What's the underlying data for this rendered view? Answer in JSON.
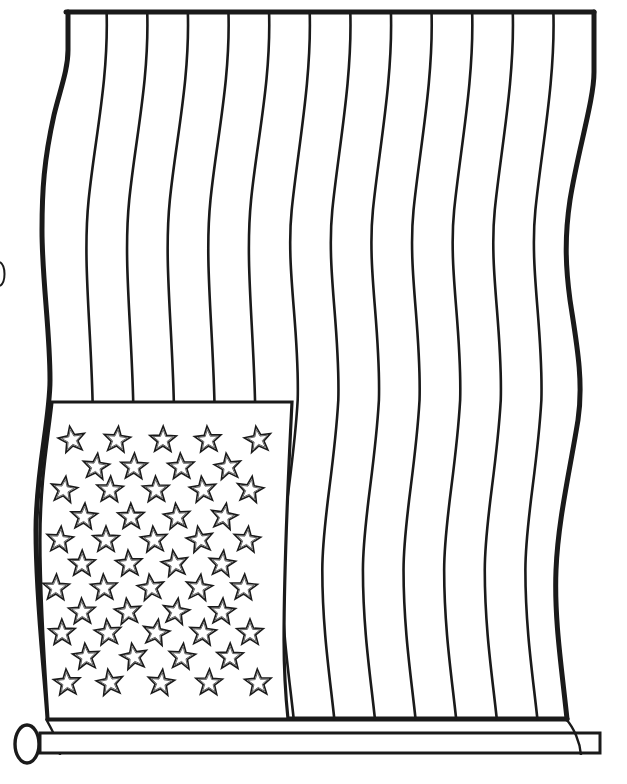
{
  "page": {
    "title": "American flag coloring page",
    "background": "#ffffff",
    "ink_color": "#1a1a1a"
  },
  "flag": {
    "stripe_count": 13,
    "divider_lines": 12,
    "star_count": 50,
    "top_edge": {
      "x1": 66,
      "x2": 594,
      "y": 12
    },
    "bottom_edge": {
      "x1": 48,
      "x2": 567,
      "y": 719
    },
    "canton": {
      "x": 48,
      "y": 402,
      "width": 244,
      "height": 317
    },
    "star_rows": [
      {
        "y": 440,
        "xs": [
          72,
          117,
          163,
          208,
          258
        ]
      },
      {
        "y": 467,
        "xs": [
          96,
          134,
          181,
          228
        ]
      },
      {
        "y": 490,
        "xs": [
          64,
          110,
          156,
          203,
          250
        ]
      },
      {
        "y": 517,
        "xs": [
          84,
          131,
          177,
          224
        ]
      },
      {
        "y": 540,
        "xs": [
          60,
          106,
          154,
          200,
          247
        ]
      },
      {
        "y": 564,
        "xs": [
          82,
          129,
          175,
          222
        ]
      },
      {
        "y": 588,
        "xs": [
          56,
          104,
          151,
          199,
          244
        ]
      },
      {
        "y": 612,
        "xs": [
          82,
          128,
          176,
          222
        ]
      },
      {
        "y": 633,
        "xs": [
          62,
          108,
          156,
          203,
          250
        ]
      },
      {
        "y": 657,
        "xs": [
          86,
          134,
          182,
          230
        ]
      },
      {
        "y": 683,
        "xs": [
          67,
          110,
          161,
          209,
          258
        ]
      }
    ]
  },
  "pole": {
    "x": 40,
    "y": 733,
    "width": 560,
    "height": 20,
    "knob": {
      "cx": 27,
      "cy": 740,
      "rx": 12,
      "ry": 19
    }
  }
}
